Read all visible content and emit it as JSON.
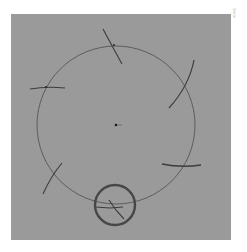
{
  "diagram": {
    "type": "geometric-construction",
    "colors": {
      "page_background": "#ffffff",
      "panel_background": "#9a9a9a",
      "stroke": "#3c3c3c",
      "highlight_stroke": "#4a4a4a"
    },
    "main_circle": {
      "cx": 105,
      "cy": 111,
      "r": 79
    },
    "center_point": {
      "cx": 105,
      "cy": 111
    },
    "construction_marks": [
      {
        "name": "top-mark",
        "x1": 92,
        "y1": 15,
        "x2": 111,
        "y2": 49
      },
      {
        "name": "top-right-arc",
        "x1": 183,
        "y1": 46,
        "x2": 160,
        "y2": 93
      },
      {
        "name": "left-mark",
        "x1": 19,
        "y1": 75,
        "x2": 53,
        "y2": 73
      },
      {
        "name": "lower-left-mark",
        "x1": 51,
        "y1": 149,
        "x2": 32,
        "y2": 179
      },
      {
        "name": "lower-right-mark",
        "x1": 151,
        "y1": 150,
        "x2": 189,
        "y2": 153
      },
      {
        "name": "bottom-mark",
        "x1": 98,
        "y1": 187,
        "x2": 112,
        "y2": 203
      }
    ],
    "highlight_circle": {
      "cx": 104,
      "cy": 191,
      "r": 20
    },
    "side_label": "5mm"
  }
}
